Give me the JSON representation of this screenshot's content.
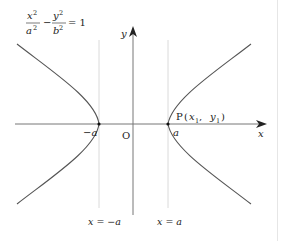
{
  "diagram": {
    "type": "hyperbola",
    "equation": {
      "x_num": "x",
      "x_exp": "2",
      "x_den": "a",
      "x_den_exp": "2",
      "minus": "−",
      "y_num": "y",
      "y_exp": "2",
      "y_den": "b",
      "y_den_exp": "2",
      "rhs": "= 1"
    },
    "axes": {
      "x_label": "x",
      "y_label": "y",
      "origin_label": "O"
    },
    "vertices": {
      "left_label": "−a",
      "right_label": "a"
    },
    "point": {
      "label_p": "P",
      "label_open": "(",
      "label_x": "x",
      "label_x_sub": "1",
      "label_comma": ",",
      "label_y": "y",
      "label_y_sub": "1",
      "label_close": ")"
    },
    "lines": {
      "left_label": "x = −a",
      "right_label": "x = a"
    },
    "colors": {
      "curve": "#555555",
      "axis": "#777777",
      "guide": "#cccccc",
      "text": "#222222"
    }
  }
}
